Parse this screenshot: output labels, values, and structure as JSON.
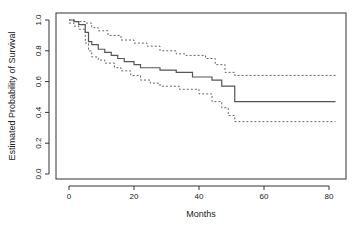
{
  "chart_data": {
    "type": "line",
    "title": "",
    "xlabel": "Months",
    "ylabel": "Estimated Probability of Survival",
    "xlim": [
      -4,
      85
    ],
    "ylim": [
      0,
      1.0
    ],
    "xticks": [
      0,
      20,
      40,
      60,
      80
    ],
    "yticks": [
      0.0,
      0.2,
      0.4,
      0.6,
      0.8,
      1.0
    ],
    "xtick_labels": [
      "0",
      "20",
      "40",
      "60",
      "80"
    ],
    "ytick_labels": [
      "0.0",
      "0.2",
      "0.4",
      "0.6",
      "0.8",
      "1.0"
    ],
    "grid": false,
    "legend": null,
    "step": true,
    "series": [
      {
        "name": "Kaplan-Meier estimate",
        "style": "solid",
        "color": "#555555",
        "x": [
          0,
          1.5,
          3,
          5,
          6,
          7,
          9,
          11,
          13,
          15,
          17,
          20,
          22,
          28,
          33,
          38,
          44,
          47,
          51,
          82
        ],
        "y": [
          1.0,
          0.99,
          0.97,
          0.92,
          0.86,
          0.84,
          0.81,
          0.79,
          0.77,
          0.75,
          0.73,
          0.71,
          0.69,
          0.675,
          0.66,
          0.63,
          0.61,
          0.57,
          0.47,
          0.47
        ]
      },
      {
        "name": "Upper 95% CI",
        "style": "dashed",
        "color": "#555555",
        "x": [
          0,
          2,
          5,
          7,
          9,
          12,
          16,
          20,
          24,
          28,
          33,
          36,
          42,
          45,
          48,
          51,
          82
        ],
        "y": [
          1.0,
          0.99,
          0.98,
          0.95,
          0.93,
          0.9,
          0.87,
          0.85,
          0.83,
          0.8,
          0.78,
          0.77,
          0.75,
          0.71,
          0.66,
          0.64,
          0.64
        ]
      },
      {
        "name": "Lower 95% CI",
        "style": "dashed",
        "color": "#555555",
        "x": [
          0,
          1.5,
          3,
          5,
          6,
          7,
          9,
          11,
          14,
          16,
          19,
          22,
          25,
          28,
          34,
          40,
          44,
          47,
          49,
          51,
          82
        ],
        "y": [
          0.98,
          0.96,
          0.94,
          0.85,
          0.8,
          0.76,
          0.74,
          0.72,
          0.69,
          0.67,
          0.64,
          0.61,
          0.59,
          0.57,
          0.55,
          0.52,
          0.47,
          0.43,
          0.38,
          0.34,
          0.34
        ]
      }
    ]
  },
  "plot": {
    "box": {
      "left": 56,
      "top": 13,
      "right": 346,
      "bottom": 179
    },
    "x_map": {
      "px0": 69,
      "px_per_unit": 3.25
    },
    "y_map": {
      "py0": 174,
      "px_per_unit": 154
    }
  }
}
